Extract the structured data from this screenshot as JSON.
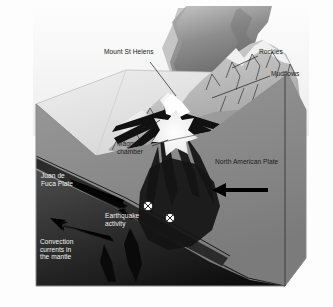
{
  "figure": {
    "kind": "geological-cross-section-diagram",
    "watermark_text": "stockx"
  },
  "labels": {
    "mount_st_helens": "Mount St Helens",
    "rockies": "Rockies",
    "mudflows": "Mudflows",
    "ice": "Ice",
    "magma_chamber": "Magma\nchamber",
    "north_american_plate": "North American Plate",
    "juan_de_fuca_plate": "Juan de\nFuca Plate",
    "earthquake_activity": "Earthquake\nactivity",
    "convection_currents": "Convection\ncurrents in\nthe mantle"
  },
  "icons": {
    "earthquake_focus": "earthquake-focus-x-marker",
    "subduction_arrow": "subduction-direction-arrow",
    "plate_motion_arrow": "plate-motion-arrow",
    "convection_arrow": "convection-current-arrow"
  },
  "colors": {
    "plume_dark": "#565656",
    "plume_light": "#b9b9b9",
    "sky": "#f4f4f4",
    "block_top": "#d9d9d9",
    "crust": "#8d8d8d",
    "mantle": "#3a3a3a",
    "mantle_deep": "#141414",
    "block_side": "#4a4a4a",
    "magma_white": "#f6f6f6",
    "label_text": "#1b1b1b",
    "label_text_light": "#f2f2f2"
  }
}
